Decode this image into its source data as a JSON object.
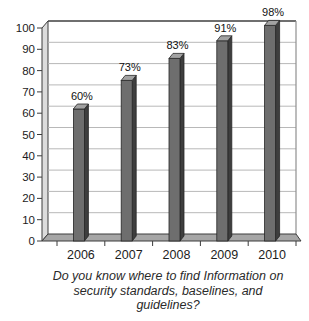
{
  "chart_data": {
    "type": "bar",
    "style": "3d-column-grayscale",
    "categories": [
      "2006",
      "2007",
      "2008",
      "2009",
      "2010"
    ],
    "values": [
      60,
      73,
      83,
      91,
      98
    ],
    "value_labels": [
      "60%",
      "73%",
      "83%",
      "91%",
      "98%"
    ],
    "title": "",
    "xlabel": "",
    "ylabel": "",
    "ylim": [
      0,
      100
    ],
    "yticks": [
      0,
      10,
      20,
      30,
      40,
      50,
      60,
      70,
      80,
      90,
      100
    ],
    "grid": "horizontal",
    "legend": "none",
    "caption_lines": [
      "Do you know where to find Information on",
      "security standards, baselines, and",
      "guidelines?"
    ]
  },
  "colors": {
    "background": "#ffffff",
    "bar_front": "#6e6e6e",
    "bar_side": "#3e3e3e",
    "bar_top": "#a2a2a2",
    "bar_outline": "#262626",
    "gridline": "#b8b8b8",
    "top_border": "#3f3f3f",
    "right_border": "#8f8f8f",
    "axis": "#3c3c3c",
    "wall": "#dcdcdc",
    "floor": "#a6a6a6",
    "text": "#1c1c1c"
  }
}
